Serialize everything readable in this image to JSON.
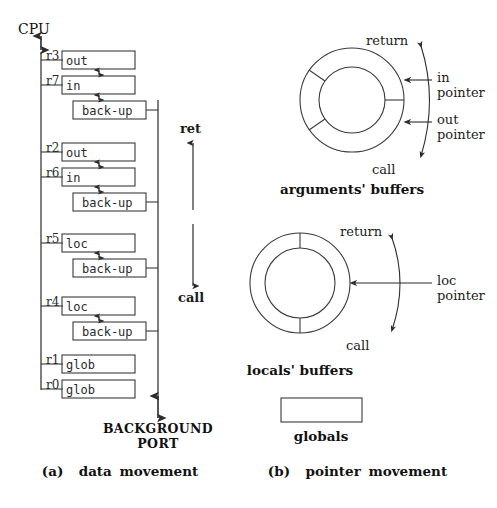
{
  "figure": {
    "width": 497,
    "height": 508,
    "background": "#ffffff",
    "line_color": "#3a3a3a",
    "text_color": "#1a1a1a"
  },
  "panel_a": {
    "cpu_label": "CPU",
    "background_port_line1": "BACKGROUND",
    "background_port_line2": "PORT",
    "bus_annotation_top": "ret",
    "bus_annotation_bottom": "call",
    "caption": "(a)  data movement",
    "register_groups": [
      {
        "group": "arguments-high",
        "rows": [
          {
            "reg": "r3",
            "cell": "out",
            "kind": "register"
          },
          {
            "reg": "r7",
            "cell": "in",
            "kind": "register"
          },
          {
            "reg": "",
            "cell": "back-up",
            "kind": "backup"
          }
        ]
      },
      {
        "group": "arguments-low",
        "rows": [
          {
            "reg": "r2",
            "cell": "out",
            "kind": "register"
          },
          {
            "reg": "r6",
            "cell": "in",
            "kind": "register"
          },
          {
            "reg": "",
            "cell": "back-up",
            "kind": "backup"
          }
        ]
      },
      {
        "group": "locals-high",
        "rows": [
          {
            "reg": "r5",
            "cell": "loc",
            "kind": "register"
          },
          {
            "reg": "",
            "cell": "back-up",
            "kind": "backup"
          }
        ]
      },
      {
        "group": "locals-low",
        "rows": [
          {
            "reg": "r4",
            "cell": "loc",
            "kind": "register"
          },
          {
            "reg": "",
            "cell": "back-up",
            "kind": "backup"
          }
        ]
      },
      {
        "group": "globals",
        "rows": [
          {
            "reg": "r1",
            "cell": "glob",
            "kind": "register"
          },
          {
            "reg": "r0",
            "cell": "glob",
            "kind": "register"
          }
        ]
      }
    ]
  },
  "panel_b": {
    "caption": "(b)  pointer movement",
    "arguments_ring": {
      "title": "arguments' buffers",
      "return_label": "return",
      "call_label": "call",
      "pointers": [
        {
          "name": "in-pointer",
          "line1": "in",
          "line2": "pointer"
        },
        {
          "name": "out-pointer",
          "line1": "out",
          "line2": "pointer"
        }
      ]
    },
    "locals_ring": {
      "title": "locals' buffers",
      "return_label": "return",
      "call_label": "call",
      "pointers": [
        {
          "name": "loc-pointer",
          "line1": "loc",
          "line2": "pointer"
        }
      ]
    },
    "globals_box": {
      "title": "globals"
    }
  }
}
